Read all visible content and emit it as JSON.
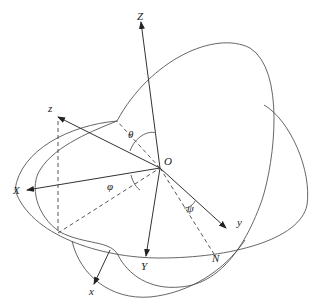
{
  "diagram": {
    "type": "euler-angles-3d",
    "labels": {
      "Z": "Z",
      "z": "z",
      "X": "X",
      "x": "x",
      "Y": "Y",
      "y": "y",
      "O": "O",
      "N": "N",
      "theta": "θ",
      "phi": "φ",
      "psi": "ψ"
    },
    "colors": {
      "line": "#333333",
      "curve": "#555555",
      "background": "#ffffff"
    }
  }
}
